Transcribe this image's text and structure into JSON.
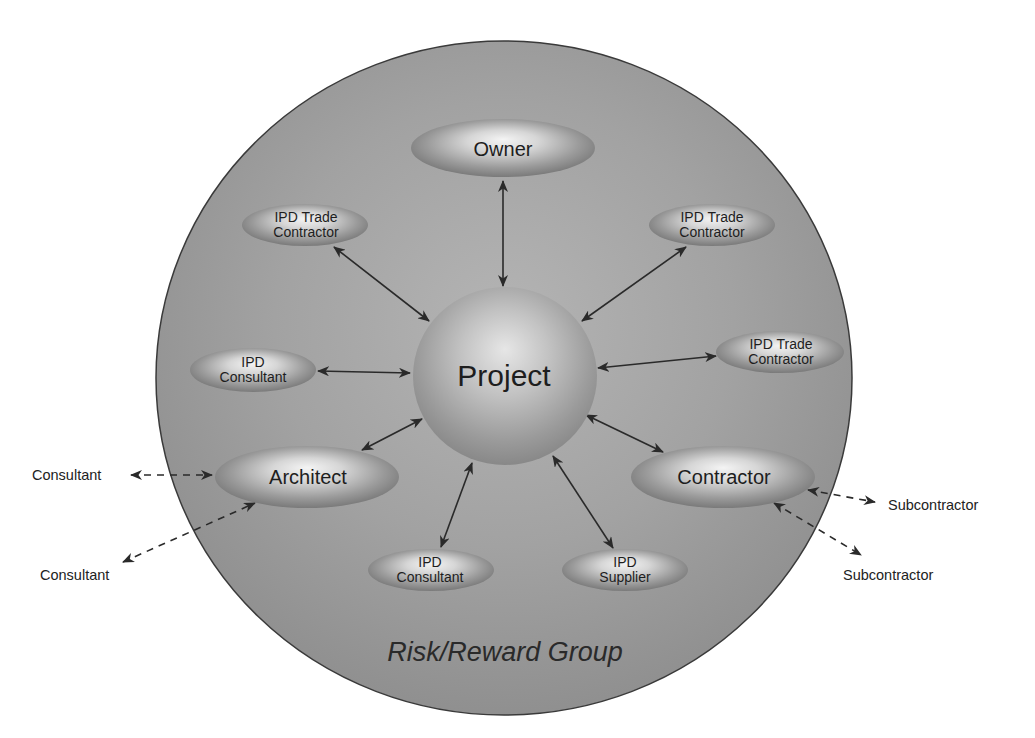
{
  "diagram": {
    "title": "Risk/Reward Group",
    "group_label": "Risk/Reward Group",
    "center": {
      "label": "Project"
    },
    "nodes": {
      "owner": {
        "label": "Owner"
      },
      "architect": {
        "label": "Architect"
      },
      "contractor": {
        "label": "Contractor"
      },
      "trade_top_left": {
        "line1": "IPD Trade",
        "line2": "Contractor"
      },
      "trade_top_right": {
        "line1": "IPD Trade",
        "line2": "Contractor"
      },
      "trade_mid_right": {
        "line1": "IPD Trade",
        "line2": "Contractor"
      },
      "consultant_left": {
        "line1": "IPD",
        "line2": "Consultant"
      },
      "consultant_bottom": {
        "line1": "IPD",
        "line2": "Consultant"
      },
      "supplier_bottom": {
        "line1": "IPD",
        "line2": "Supplier"
      }
    },
    "external": {
      "consultant_1": "Consultant",
      "consultant_2": "Consultant",
      "subcontractor_1": "Subcontractor",
      "subcontractor_2": "Subcontractor"
    },
    "edges": [
      {
        "from": "Project",
        "to": "Owner",
        "style": "solid",
        "direction": "both"
      },
      {
        "from": "Project",
        "to": "IPD Trade Contractor (top-left)",
        "style": "solid",
        "direction": "both"
      },
      {
        "from": "Project",
        "to": "IPD Trade Contractor (top-right)",
        "style": "solid",
        "direction": "both"
      },
      {
        "from": "Project",
        "to": "IPD Trade Contractor (mid-right)",
        "style": "solid",
        "direction": "both"
      },
      {
        "from": "Project",
        "to": "IPD Consultant (left)",
        "style": "solid",
        "direction": "both"
      },
      {
        "from": "Project",
        "to": "Architect",
        "style": "solid",
        "direction": "both"
      },
      {
        "from": "Project",
        "to": "Contractor",
        "style": "solid",
        "direction": "both"
      },
      {
        "from": "Project",
        "to": "IPD Consultant (bottom)",
        "style": "solid",
        "direction": "both"
      },
      {
        "from": "Project",
        "to": "IPD Supplier",
        "style": "solid",
        "direction": "both"
      },
      {
        "from": "Architect",
        "to": "Consultant",
        "style": "dashed",
        "direction": "both"
      },
      {
        "from": "Architect",
        "to": "Consultant (lower)",
        "style": "dashed",
        "direction": "both"
      },
      {
        "from": "Contractor",
        "to": "Subcontractor",
        "style": "dashed",
        "direction": "both"
      },
      {
        "from": "Contractor",
        "to": "Subcontractor (lower)",
        "style": "dashed",
        "direction": "both"
      }
    ],
    "colors": {
      "group_fill": "#9a9a9a",
      "group_stroke": "#3a3a3a",
      "node_light": "#f2f2f2",
      "node_dark": "#7c7c7c",
      "arrow": "#2a2a2a",
      "text": "#1e1e1e"
    }
  }
}
